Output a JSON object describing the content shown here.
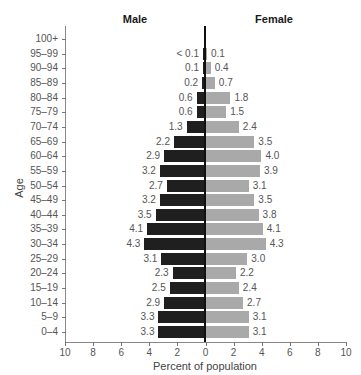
{
  "chart_data": {
    "type": "bar",
    "subtype": "population-pyramid",
    "title": "",
    "xlabel": "Percent of population",
    "ylabel": "Age",
    "xlim": [
      -10,
      10
    ],
    "x_ticks": [
      "10",
      "8",
      "6",
      "4",
      "2",
      "0",
      "2",
      "4",
      "6",
      "8",
      "10"
    ],
    "grid": false,
    "legend_position": "top (side headings)",
    "categories": [
      "100+",
      "95–99",
      "90–94",
      "85–89",
      "80–84",
      "75–79",
      "70–74",
      "65–69",
      "60–64",
      "55–59",
      "50–54",
      "45–49",
      "40–44",
      "35–39",
      "30–34",
      "25–29",
      "20–24",
      "15–19",
      "10–14",
      "5–9",
      "0–4"
    ],
    "series": [
      {
        "name": "Male",
        "color": "#1f1f1f",
        "side": "left",
        "values": [
          null,
          0.05,
          0.1,
          0.2,
          0.6,
          0.6,
          1.3,
          2.2,
          2.9,
          3.2,
          2.7,
          3.2,
          3.5,
          4.1,
          4.3,
          3.1,
          2.3,
          2.5,
          2.9,
          3.3,
          3.3
        ],
        "labels": [
          "",
          "< 0.1",
          "0.1",
          "0.2",
          "0.6",
          "0.6",
          "1.3",
          "2.2",
          "2.9",
          "3.2",
          "2.7",
          "3.2",
          "3.5",
          "4.1",
          "4.3",
          "3.1",
          "2.3",
          "2.5",
          "2.9",
          "3.3",
          "3.3"
        ]
      },
      {
        "name": "Female",
        "color": "#a9a9a9",
        "side": "right",
        "values": [
          null,
          0.1,
          0.4,
          0.7,
          1.8,
          1.5,
          2.4,
          3.5,
          4.0,
          3.9,
          3.1,
          3.5,
          3.8,
          4.1,
          4.3,
          3.0,
          2.2,
          2.4,
          2.7,
          3.1,
          3.1
        ],
        "labels": [
          "",
          "0.1",
          "0.4",
          "0.7",
          "1.8",
          "1.5",
          "2.4",
          "3.5",
          "4.0",
          "3.9",
          "3.1",
          "3.5",
          "3.8",
          "4.1",
          "4.3",
          "3.0",
          "2.2",
          "2.4",
          "2.7",
          "3.1",
          "3.1"
        ]
      }
    ]
  },
  "headings": {
    "male": "Male",
    "female": "Female"
  }
}
